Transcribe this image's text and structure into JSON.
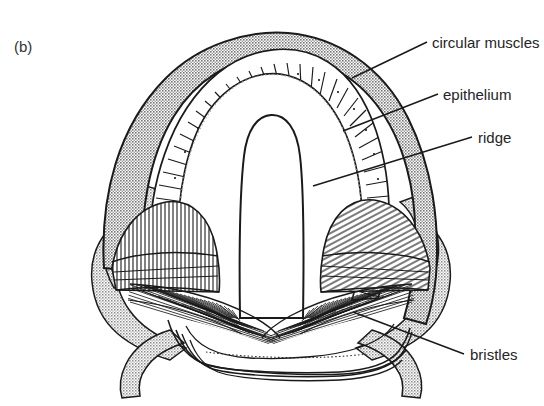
{
  "figure": {
    "panel_label": "(b)",
    "background_color": "#ffffff",
    "ink_color": "#1a1a1a",
    "muscle_fill": "#9a9a9a",
    "epithelium_fill": "#ffffff",
    "lobe_fill": "#a0a0a0",
    "text_color": "#252525"
  },
  "labels": [
    {
      "id": "circular-muscles",
      "text": "circular muscles",
      "x": 432,
      "y": 48,
      "leader": {
        "x1": 427,
        "y1": 42,
        "x2": 352,
        "y2": 78
      }
    },
    {
      "id": "epithelium",
      "text": "epithelium",
      "x": 443,
      "y": 100,
      "leader": {
        "x1": 438,
        "y1": 94,
        "x2": 343,
        "y2": 131
      }
    },
    {
      "id": "ridge",
      "text": "ridge",
      "x": 478,
      "y": 143,
      "leader": {
        "x1": 472,
        "y1": 137,
        "x2": 313,
        "y2": 186
      }
    },
    {
      "id": "bristles",
      "text": "bristles",
      "x": 470,
      "y": 360,
      "leader": {
        "x1": 464,
        "y1": 354,
        "x2": 353,
        "y2": 312
      }
    }
  ],
  "structures": [
    {
      "name": "circular-muscle-band",
      "description": "outer grey arched band"
    },
    {
      "name": "epithelium-layer",
      "description": "radially striated cell layer with nuclei"
    },
    {
      "name": "central-ridge",
      "description": "tongue-shaped median lobe"
    },
    {
      "name": "bristle-fan-left",
      "description": "dense fan of bristle fibres, left"
    },
    {
      "name": "bristle-fan-right",
      "description": "dense fan of bristle fibres, right"
    },
    {
      "name": "hatched-mound-left",
      "description": "vertically hatched lateral mound"
    },
    {
      "name": "hatched-mound-right",
      "description": "diagonally hatched lateral mound"
    },
    {
      "name": "outer-lobes-left",
      "description": "scalloped grey outer lobes, left"
    },
    {
      "name": "outer-lobes-right",
      "description": "scalloped grey outer lobes, right"
    },
    {
      "name": "basal-plate",
      "description": "nested contour lines forming base"
    }
  ]
}
